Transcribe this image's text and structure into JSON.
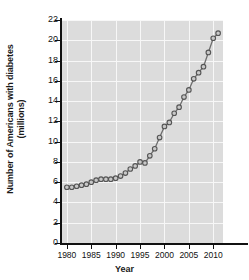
{
  "chart_data": {
    "type": "line",
    "title": "",
    "xlabel": "Year",
    "ylabel": "Number of Americans with diabetes (millions)",
    "ylabel_line1": "Number of Americans with diabetes",
    "ylabel_line2": "(millions)",
    "xlim": [
      1979,
      2012
    ],
    "ylim": [
      0,
      22
    ],
    "ytick_step": 2,
    "xtick_step": 5,
    "grid": true,
    "legend": null,
    "marker": "open-circle",
    "series_name": "Americans with diabetes",
    "x": [
      1980,
      1981,
      1982,
      1983,
      1984,
      1985,
      1986,
      1987,
      1988,
      1989,
      1990,
      1991,
      1992,
      1993,
      1994,
      1995,
      1996,
      1997,
      1998,
      1999,
      2000,
      2001,
      2002,
      2003,
      2004,
      2005,
      2006,
      2007,
      2008,
      2009,
      2010,
      2011
    ],
    "values": [
      5.5,
      5.5,
      5.6,
      5.7,
      5.8,
      6.0,
      6.2,
      6.3,
      6.3,
      6.3,
      6.4,
      6.6,
      6.9,
      7.3,
      7.6,
      8.0,
      7.9,
      8.6,
      9.3,
      10.4,
      11.5,
      11.9,
      12.8,
      13.4,
      14.4,
      15.1,
      16.2,
      16.8,
      17.4,
      18.8,
      20.2,
      20.7
    ],
    "ytick_labels": [
      "0",
      "2",
      "4",
      "6",
      "8",
      "10",
      "12",
      "14",
      "16",
      "18",
      "20",
      "22"
    ],
    "xtick_labels": [
      "1980",
      "1985",
      "1990",
      "1995",
      "2000",
      "2005",
      "2010"
    ],
    "xticks": [
      1980,
      1985,
      1990,
      1995,
      2000,
      2005,
      2010
    ],
    "colors": {
      "plot_background": "#dcdcdc",
      "gridline": "#f7f7f7",
      "axis": "#111111",
      "line": "#6e6e6e",
      "marker_stroke": "#555555",
      "marker_fill": "#c8c8c8",
      "text": "#111111",
      "page_background": "#ffffff"
    }
  }
}
